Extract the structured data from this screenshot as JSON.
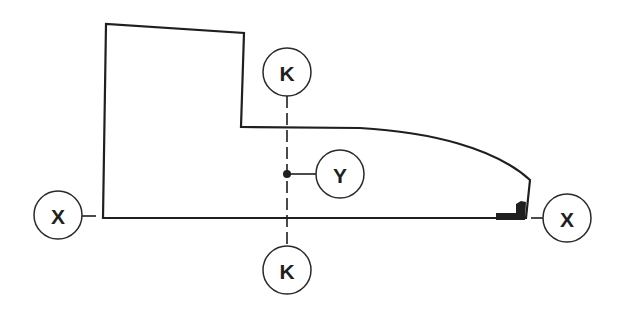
{
  "diagram": {
    "type": "technical-profile-drawing",
    "colors": {
      "line": "#1f1f1f",
      "background": "#ffffff"
    },
    "labels": {
      "k_top": "K",
      "k_bottom": "K",
      "y": "Y",
      "x_left": "X",
      "x_right": "X"
    },
    "callouts": [
      {
        "id": "k_top",
        "label": "K",
        "meaning": "vertical reference axis K-K (top end)"
      },
      {
        "id": "k_bottom",
        "label": "K",
        "meaning": "vertical reference axis K-K (bottom end)"
      },
      {
        "id": "y",
        "label": "Y",
        "meaning": "point on axis K-K"
      },
      {
        "id": "x_left",
        "label": "X",
        "meaning": "horizontal baseline X-X (left end)"
      },
      {
        "id": "x_right",
        "label": "X",
        "meaning": "horizontal baseline X-X (right end)"
      }
    ]
  }
}
